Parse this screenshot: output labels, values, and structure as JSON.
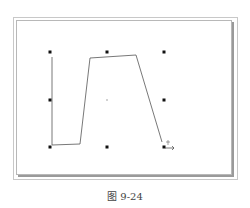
{
  "figure": {
    "caption": "图 9-24",
    "handles": [
      {
        "x": 50,
        "y": 52
      },
      {
        "x": 107,
        "y": 52
      },
      {
        "x": 164,
        "y": 52
      },
      {
        "x": 50,
        "y": 100
      },
      {
        "x": 164,
        "y": 100
      },
      {
        "x": 50,
        "y": 147
      },
      {
        "x": 107,
        "y": 147
      },
      {
        "x": 164,
        "y": 147
      }
    ],
    "center": {
      "x": 107,
      "y": 100
    },
    "polyline": "52,57 52,145 80,144 90,58 136,55 162,142",
    "cursor": "move-cursor"
  }
}
